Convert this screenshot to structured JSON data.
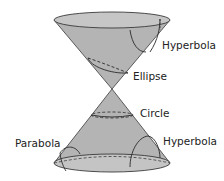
{
  "diagram": {
    "labels": {
      "hyperbola_top": "Hyperbola",
      "ellipse": "Ellipse",
      "circle": "Circle",
      "parabola": "Parabola",
      "hyperbola_bottom": "Hyperbola"
    },
    "colors": {
      "cone_fill": "#b4b4b4",
      "rim_fill": "#c8c8c8",
      "stroke": "#3a3a3a",
      "text": "#222222"
    }
  }
}
